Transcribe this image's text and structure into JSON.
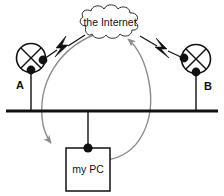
{
  "diagram": {
    "background_color": "#ffffff",
    "stroke_color": "#111111",
    "arrow_color": "#8c8c8c",
    "cloud": {
      "label": "the Internet",
      "icon": "cloud-icon"
    },
    "nodes": [
      {
        "id": "A",
        "label": "A",
        "icon": "antenna-node-icon",
        "description": "crossed-circle access point"
      },
      {
        "id": "B",
        "label": "B",
        "icon": "antenna-node-icon",
        "description": "crossed-circle access point"
      }
    ],
    "computer": {
      "label": "my PC",
      "icon": "pc-box-icon"
    },
    "links": [
      {
        "id": "a-to-cloud",
        "icon": "lightning-bolt-icon",
        "from": "A",
        "to": "the Internet"
      },
      {
        "id": "b-to-cloud",
        "icon": "lightning-bolt-icon",
        "from": "B",
        "to": "the Internet"
      }
    ],
    "flows": [
      {
        "id": "downstream",
        "icon": "curved-arrow-icon",
        "from": "the Internet",
        "to": "my PC"
      },
      {
        "id": "upstream",
        "icon": "curved-arrow-icon",
        "from": "my PC",
        "to": "the Internet"
      }
    ],
    "bus": {
      "id": "ground-bus",
      "icon": "horizontal-bus-line"
    }
  }
}
